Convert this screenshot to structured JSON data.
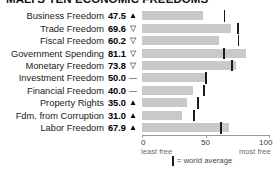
{
  "chart_data": {
    "type": "bar",
    "title": "MALI'S TEN ECONOMIC FREEDOMS",
    "orientation": "horizontal",
    "xlabel": "",
    "ylabel": "",
    "xlim": [
      0,
      100
    ],
    "grid": false,
    "legend_position": "bottom-center",
    "categories": [
      "Business Freedom",
      "Trade Freedom",
      "Fiscal Freedom",
      "Government Spending",
      "Monetary Freedom",
      "Investment Freedom",
      "Financial Freedom",
      "Property Rights",
      "Fdm. from Corruption",
      "Labor Freedom"
    ],
    "values": [
      47.5,
      69.6,
      60.2,
      81.1,
      73.8,
      50.0,
      40.0,
      35.0,
      31.0,
      67.9
    ],
    "value_labels": [
      "47.5",
      "69.6",
      "60.2",
      "81.1",
      "73.8",
      "50.0",
      "40.0",
      "35.0",
      "31.0",
      "67.9"
    ],
    "trend_indicators": [
      "up",
      "down",
      "down",
      "down",
      "down",
      "flat",
      "flat",
      "up",
      "up",
      "up"
    ],
    "trend_glyphs": [
      "▲",
      "▽",
      "▽",
      "▽",
      "▽",
      "—",
      "—",
      "▲",
      "▲",
      "▲"
    ],
    "world_average": [
      64.3,
      74.8,
      75.4,
      63.9,
      70.4,
      50.2,
      48.5,
      43.8,
      40.5,
      61.5
    ],
    "series": [
      {
        "name": "Mali score",
        "values": [
          47.5,
          69.6,
          60.2,
          81.1,
          73.8,
          50.0,
          40.0,
          35.0,
          31.0,
          67.9
        ]
      },
      {
        "name": "world average",
        "values": [
          64.3,
          74.8,
          75.4,
          63.9,
          70.4,
          50.2,
          48.5,
          43.8,
          40.5,
          61.5
        ]
      }
    ],
    "xticks": [
      0,
      50,
      100
    ],
    "xtick_labels": [
      "0",
      "50",
      "100"
    ],
    "axis_annotations": {
      "left": "least free",
      "right": "most free"
    },
    "legend_label": "= world average",
    "colors": {
      "bar": "#c9c9c9",
      "average_tick": "#1b1b1b",
      "axis": "#9a9a9a",
      "text": "#1a1a1a"
    }
  },
  "rows": [
    {
      "label": "Business Freedom",
      "value": "47.5",
      "indicator": "▲"
    },
    {
      "label": "Trade Freedom",
      "value": "69.6",
      "indicator": "▽"
    },
    {
      "label": "Fiscal Freedom",
      "value": "60.2",
      "indicator": "▽"
    },
    {
      "label": "Government Spending",
      "value": "81.1",
      "indicator": "▽"
    },
    {
      "label": "Monetary Freedom",
      "value": "73.8",
      "indicator": "▽"
    },
    {
      "label": "Investment Freedom",
      "value": "50.0",
      "indicator": "—"
    },
    {
      "label": "Financial Freedom",
      "value": "40.0",
      "indicator": "—"
    },
    {
      "label": "Property Rights",
      "value": "35.0",
      "indicator": "▲"
    },
    {
      "label": "Fdm. from Corruption",
      "value": "31.0",
      "indicator": "▲"
    },
    {
      "label": "Labor Freedom",
      "value": "67.9",
      "indicator": "▲"
    }
  ],
  "axis": {
    "tick_0": "0",
    "tick_50": "50",
    "tick_100": "100",
    "least_free": "least free",
    "most_free": "most free"
  },
  "legend": {
    "text": "= world average"
  }
}
